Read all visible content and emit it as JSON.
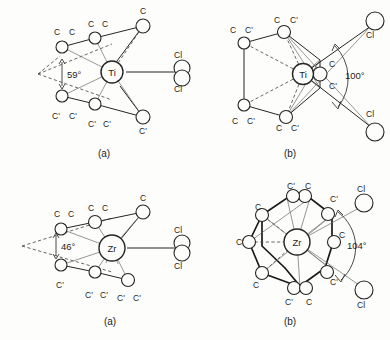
{
  "figure": {
    "background_color": "#fdfdfb",
    "ink_color": "#252525"
  },
  "panels": [
    {
      "id": "ti-a",
      "caption": "(a)",
      "metal": "Ti",
      "angle_value": "59°",
      "angle_type": "ring-centroid-metal-ring-centroid",
      "chloride_labels": [
        "Cl",
        "Cl"
      ],
      "carbon_labels_upper": [
        "C",
        "C",
        "C",
        "C",
        "C"
      ],
      "carbon_labels_lower": [
        "C'",
        "C'",
        "C'",
        "C'",
        "C'"
      ]
    },
    {
      "id": "ti-b",
      "caption": "(b)",
      "metal": "Ti",
      "angle_value": "100°",
      "angle_type": "Cl-metal-Cl",
      "chloride_labels": [
        "Cl",
        "Cl"
      ],
      "carbon_labels": [
        "C",
        "C'",
        "C",
        "C'",
        "C",
        "C'",
        "C",
        "C'",
        "C",
        "C'"
      ]
    },
    {
      "id": "zr-a",
      "caption": "(a)",
      "metal": "Zr",
      "angle_value": "46°",
      "angle_type": "ring-centroid-metal-ring-centroid",
      "chloride_labels": [
        "Cl",
        "Cl"
      ],
      "carbon_labels_upper": [
        "C",
        "C",
        "C",
        "C",
        "C"
      ],
      "carbon_labels_lower": [
        "C'",
        "C'",
        "C'",
        "C'",
        "C'"
      ]
    },
    {
      "id": "zr-b",
      "caption": "(b)",
      "metal": "Zr",
      "angle_value": "104°",
      "angle_type": "Cl-metal-Cl",
      "chloride_labels": [
        "Cl",
        "Cl",
        "Cl"
      ],
      "carbon_labels": [
        "C'",
        "C",
        "C",
        "C'",
        "C'",
        "C",
        "C",
        "C'",
        "C'",
        "C"
      ]
    }
  ],
  "labels": {
    "ti": "Ti",
    "zr": "Zr",
    "cl": "Cl",
    "c": "C",
    "c_prime": "C'",
    "angle_ti_a": "59°",
    "angle_ti_b": "100°",
    "angle_zr_a": "46°",
    "angle_zr_b": "104°",
    "caption_a": "(a)",
    "caption_b": "(b)"
  }
}
